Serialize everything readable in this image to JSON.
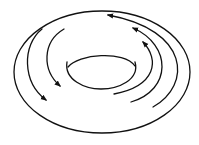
{
  "diagram": {
    "stroke_color": "#111111",
    "background": "#ffffff",
    "outer_ellipse": {
      "cx": 102,
      "cy": 72,
      "rx": 88,
      "ry": 61
    },
    "inner_hole": {
      "cx": 101,
      "cy": 71,
      "rx": 34,
      "ry": 18
    },
    "arrows": [
      {
        "id": "left-outer",
        "direction": "clockwise-down"
      },
      {
        "id": "left-inner",
        "direction": "clockwise-down"
      },
      {
        "id": "right-outer",
        "direction": "counterclockwise-up"
      },
      {
        "id": "right-middle",
        "direction": "counterclockwise-up"
      },
      {
        "id": "right-inner",
        "direction": "counterclockwise-up"
      }
    ]
  }
}
